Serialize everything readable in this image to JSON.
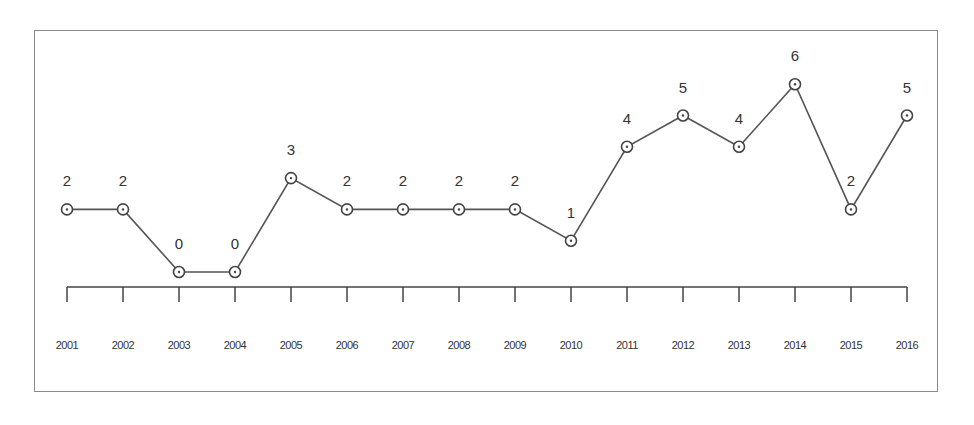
{
  "chart_data": {
    "type": "line",
    "title": "",
    "xlabel": "",
    "ylabel": "",
    "categories": [
      "2001",
      "2002",
      "2003",
      "2004",
      "2005",
      "2006",
      "2007",
      "2008",
      "2009",
      "2010",
      "2011",
      "2012",
      "2013",
      "2014",
      "2015",
      "2016"
    ],
    "series": [
      {
        "name": "count",
        "values": [
          2,
          2,
          0,
          0,
          3,
          2,
          2,
          2,
          2,
          1,
          4,
          5,
          4,
          6,
          2,
          5
        ]
      }
    ],
    "data_labels": true,
    "markers": "open-circle",
    "grid": false,
    "legend": null,
    "ylim": [
      0,
      6
    ],
    "colors": {
      "line": "#555555",
      "marker": "#444444",
      "text": "#333333",
      "frame": "#8a8a8a"
    }
  }
}
